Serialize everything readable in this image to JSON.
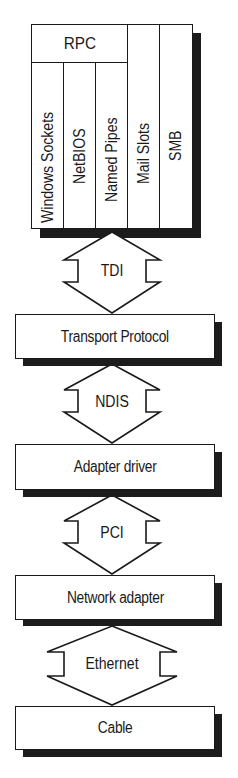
{
  "diagram": {
    "type": "network-stack",
    "colors": {
      "stroke": "#1a1a1a",
      "shadow": "#1c1c1c",
      "fill": "#ffffff"
    },
    "top_stack": {
      "rpc_label": "RPC",
      "columns": [
        {
          "label": "Windows Sockets"
        },
        {
          "label": "NetBIOS"
        },
        {
          "label": "Named Pipes"
        },
        {
          "label": "Mail Slots"
        },
        {
          "label": "SMB"
        }
      ]
    },
    "interfaces": [
      {
        "label": "TDI"
      },
      {
        "label": "NDIS"
      },
      {
        "label": "PCI"
      },
      {
        "label": "Ethernet"
      }
    ],
    "layers": [
      {
        "label": "Transport Protocol"
      },
      {
        "label": "Adapter driver"
      },
      {
        "label": "Network adapter"
      },
      {
        "label": "Cable"
      }
    ]
  }
}
